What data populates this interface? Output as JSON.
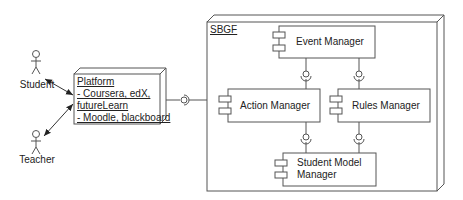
{
  "diagram": {
    "type": "UML component/deployment diagram",
    "colors": {
      "stroke": "#555555",
      "text": "#222222",
      "background": "#ffffff"
    },
    "actors": [
      {
        "id": "student",
        "label": "Student"
      },
      {
        "id": "teacher",
        "label": "Teacher"
      }
    ],
    "platform_node": {
      "title": "Platform",
      "lines": [
        "- Coursera, edX,",
        " futureLearn",
        "- Moodle, blackboard"
      ]
    },
    "sbgf_node": {
      "title": "SBGF",
      "components": [
        {
          "id": "event",
          "label": "Event Manager"
        },
        {
          "id": "action",
          "label": "Action Manager"
        },
        {
          "id": "rules",
          "label": "Rules Manager"
        },
        {
          "id": "student_model",
          "label_line1": "Student Model",
          "label_line2": "Manager"
        }
      ]
    },
    "connections": [
      {
        "from": "student",
        "to": "platform",
        "type": "bidirectional-arrow"
      },
      {
        "from": "teacher",
        "to": "platform",
        "type": "bidirectional-arrow"
      },
      {
        "from": "platform",
        "to": "sbgf",
        "type": "interface-lollipop"
      },
      {
        "from": "event",
        "to": "action",
        "type": "interface-lollipop"
      },
      {
        "from": "event",
        "to": "rules",
        "type": "interface-lollipop"
      },
      {
        "from": "action",
        "to": "student_model",
        "type": "interface-lollipop"
      },
      {
        "from": "rules",
        "to": "student_model",
        "type": "interface-lollipop"
      }
    ]
  }
}
